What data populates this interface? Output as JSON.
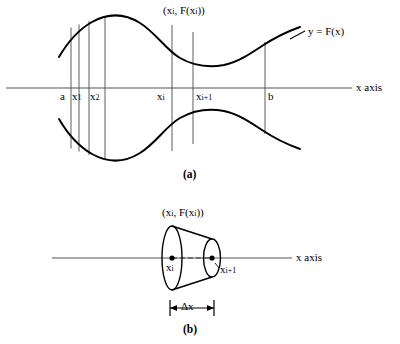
{
  "figure": {
    "panels": [
      {
        "id": "a",
        "caption": "(a)",
        "axis_label": "x axis",
        "curve_label": "y = F(x)",
        "point_label": "(xi, F(xi))",
        "tick_labels": [
          "a",
          "x1",
          "x2",
          "xi",
          "xi+1",
          "b"
        ]
      },
      {
        "id": "b",
        "caption": "(b)",
        "axis_label": "x axis",
        "point_label": "(xi, F(xi))",
        "left_point_label": "xi",
        "right_point_label": "xi+1",
        "width_label": "Δx"
      }
    ]
  },
  "labels": {
    "a_point_top": {
      "base1": "(x",
      "sub1": "i",
      "mid": ", F(x",
      "sub2": "i",
      "end": "))"
    },
    "a_curve": {
      "y": "y",
      "eq": " = ",
      "fn": "F(x)"
    },
    "a_axis": {
      "x": "x",
      "axis": " axis"
    },
    "tick_a": {
      "base": "a"
    },
    "tick_x1": {
      "base": "x",
      "sub": "1"
    },
    "tick_x2": {
      "base": "x",
      "sub": "2"
    },
    "tick_xi": {
      "base": "x",
      "sub": "i"
    },
    "tick_xi1": {
      "base": "x",
      "sub": "i+1"
    },
    "tick_b": {
      "base": "b"
    },
    "caption_a": {
      "text": "(a)"
    },
    "b_point_top": {
      "base1": "(x",
      "sub1": "i",
      "mid": ", F(x",
      "sub2": "i",
      "end": "))"
    },
    "b_axis": {
      "x": "x",
      "axis": " axis"
    },
    "b_xi": {
      "base": "x",
      "sub": "i"
    },
    "b_xi1": {
      "base": "x",
      "sub": "i+1"
    },
    "b_delta": {
      "text": "Δx"
    },
    "caption_b": {
      "text": "(b)"
    }
  },
  "colors": {
    "ink": "#000000",
    "thin_rule": "#555555",
    "background": "#ffffff"
  },
  "geometry": {
    "panel_a": {
      "axis_y": 88,
      "axis_x_start": 6,
      "axis_x_end": 352,
      "vertical_lines_x": [
        71,
        79,
        89,
        105,
        172,
        193,
        265
      ]
    },
    "panel_b": {
      "axis_y": 258,
      "axis_x_start": 52,
      "axis_x_end": 292,
      "left_ellipse_cx": 172,
      "right_ellipse_cx": 212,
      "delta_y": 308
    }
  }
}
